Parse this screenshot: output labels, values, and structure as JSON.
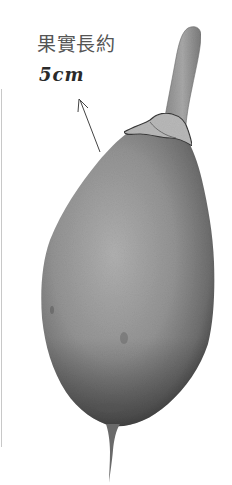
{
  "annotation": {
    "title": "果實長約",
    "size": "5cm"
  },
  "figure": {
    "colors": {
      "background": "#ffffff",
      "fruit_light": "#a8a8a8",
      "fruit_mid": "#8a8a8a",
      "fruit_dark": "#4a4a4a",
      "stem": "#9a9a9a",
      "calyx": "#b5b5b5",
      "text": "#555555",
      "handwriting": "#2a2a2a",
      "arrow": "#444444"
    }
  }
}
